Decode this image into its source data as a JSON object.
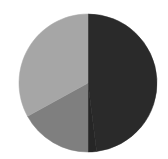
{
  "chart_data": {
    "type": "pie",
    "title": "",
    "categories": [
      "Slice A",
      "Slice B",
      "Slice C",
      "Slice D"
    ],
    "values": [
      48,
      2,
      17,
      33
    ],
    "colors": [
      "#2a2a2a",
      "#262626",
      "#7f7f7f",
      "#a6a6a6"
    ],
    "start_angle_deg": 0,
    "direction": "clockwise",
    "legend": "none",
    "center": [
      88,
      83
    ],
    "radius": 69
  }
}
